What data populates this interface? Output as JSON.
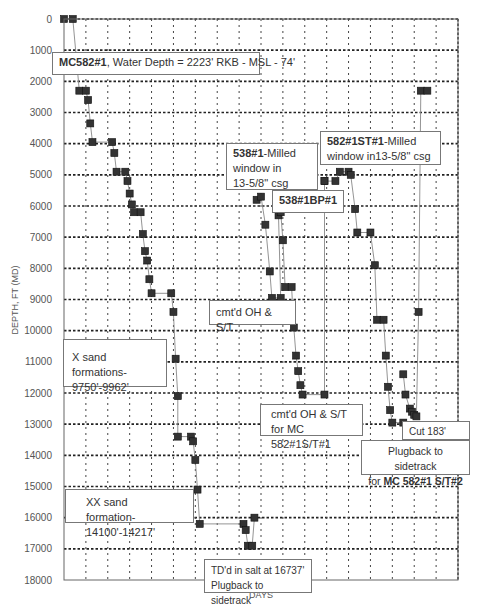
{
  "chart_data": {
    "type": "line",
    "title": "",
    "xlabel": "DAYS",
    "ylabel": "DEPTH, FT (MD)",
    "ylim": [
      0,
      18000
    ],
    "y_inverted": true,
    "xlim": [
      0,
      18
    ],
    "grid": true,
    "yticks": [
      0,
      1000,
      2000,
      3000,
      4000,
      5000,
      6000,
      7000,
      8000,
      9000,
      10000,
      11000,
      12000,
      13000,
      14000,
      15000,
      16000,
      17000,
      18000
    ],
    "series": [
      {
        "name": "MC582#1 original hole",
        "points": [
          [
            0.0,
            0
          ],
          [
            0.4,
            0
          ],
          [
            0.7,
            2300
          ],
          [
            1.0,
            2300
          ],
          [
            1.1,
            2600
          ],
          [
            1.2,
            3350
          ],
          [
            1.3,
            3950
          ],
          [
            2.2,
            3950
          ],
          [
            2.3,
            4300
          ],
          [
            2.4,
            4900
          ],
          [
            2.8,
            4900
          ],
          [
            2.9,
            5200
          ],
          [
            3.0,
            5600
          ],
          [
            3.1,
            5950
          ],
          [
            3.2,
            6200
          ],
          [
            3.5,
            6200
          ],
          [
            3.6,
            6900
          ],
          [
            3.7,
            7450
          ],
          [
            3.8,
            7750
          ],
          [
            3.9,
            8350
          ],
          [
            4.0,
            8800
          ],
          [
            4.9,
            8800
          ],
          [
            5.0,
            9400
          ],
          [
            5.1,
            10900
          ],
          [
            5.2,
            12100
          ],
          [
            5.2,
            13400
          ],
          [
            5.8,
            13400
          ],
          [
            5.9,
            13550
          ],
          [
            6.0,
            14150
          ],
          [
            6.1,
            15100
          ],
          [
            6.2,
            16200
          ],
          [
            8.2,
            16200
          ],
          [
            8.3,
            16400
          ],
          [
            8.4,
            16900
          ],
          [
            8.6,
            16900
          ],
          [
            8.7,
            16000
          ]
        ]
      },
      {
        "name": "538#1 milled window / 538#1BP#1",
        "points": [
          [
            8.8,
            5800
          ],
          [
            9.0,
            5700
          ],
          [
            9.2,
            6600
          ],
          [
            9.4,
            8100
          ],
          [
            9.5,
            8950
          ],
          [
            9.9,
            8950
          ],
          [
            9.8,
            6300
          ],
          [
            9.9,
            6200
          ],
          [
            10.0,
            7100
          ],
          [
            10.1,
            8600
          ],
          [
            10.4,
            8600
          ],
          [
            10.5,
            9900
          ],
          [
            10.6,
            10800
          ],
          [
            10.7,
            11300
          ],
          [
            10.8,
            11750
          ],
          [
            10.9,
            12050
          ],
          [
            11.9,
            12050
          ],
          [
            11.9,
            5200
          ]
        ]
      },
      {
        "name": "582#1ST#1",
        "points": [
          [
            11.9,
            5200
          ],
          [
            12.4,
            5200
          ],
          [
            12.6,
            4900
          ],
          [
            13.0,
            4900
          ],
          [
            13.1,
            5000
          ],
          [
            13.3,
            6100
          ],
          [
            13.4,
            6850
          ],
          [
            14.0,
            6850
          ],
          [
            14.2,
            7900
          ],
          [
            14.3,
            9650
          ],
          [
            14.6,
            9650
          ],
          [
            14.7,
            10800
          ],
          [
            14.8,
            11800
          ],
          [
            14.9,
            12550
          ],
          [
            15.0,
            12950
          ],
          [
            15.5,
            12950
          ]
        ]
      },
      {
        "name": "MC582#1 S/T#2",
        "points": [
          [
            15.5,
            11400
          ],
          [
            15.6,
            12050
          ],
          [
            15.8,
            12500
          ],
          [
            15.9,
            12600
          ],
          [
            16.0,
            12700
          ],
          [
            16.1,
            12750
          ],
          [
            16.2,
            9400
          ],
          [
            16.3,
            2300
          ],
          [
            16.6,
            2300
          ]
        ]
      }
    ],
    "annotations": [
      {
        "text": "MC582#1, Water Depth = 2223' RKB - MSL - 74'",
        "bold_part": "MC582#1"
      },
      {
        "text": "538#1-Milled window in 13-5/8\" csg",
        "bold_part": "538#1"
      },
      {
        "text": "538#1BP#1"
      },
      {
        "text": "582#1ST#1-Milled window in13-5/8\" csg",
        "bold_part": "582#1ST#1"
      },
      {
        "text": "cmt'd OH & S/T"
      },
      {
        "text": "X sand formations- 9750'-9962'"
      },
      {
        "text": "cmt'd OH & S/T for MC 582#1S/T#1"
      },
      {
        "text": "Cut 183' conv."
      },
      {
        "text": "Plugback to sidetrack for MC 582#1 S/T#2",
        "bold_part": "MC 582#1 S/T#2"
      },
      {
        "text": "XX sand formation- 14100'-14217'"
      },
      {
        "text": "TD'd in salt at 16737' Plugback to sidetrack"
      }
    ]
  },
  "labels": {
    "xlabel": "DAYS",
    "ylabel": "DEPTH, FT (MD)",
    "note_water_depth_bold": "MC582#1",
    "note_water_depth_rest": ", Water Depth = 2223' RKB - MSL - 74'",
    "note_538_bold": "538#1",
    "note_538_rest": "-Milled\nwindow in\n13-5/8\" csg",
    "note_538bp": "538#1BP#1",
    "note_582st_bold": "582#1ST#1",
    "note_582st_rest": "-Milled\nwindow in13-5/8\" csg",
    "note_cmtd1": "cmt'd OH & S/T",
    "note_xsand": "X sand formations-\n9750'-9962'",
    "note_cmtd2": "cmt'd OH & S/T\nfor MC 582#1S/T#1",
    "note_cut": "Cut 183' conv.",
    "note_plugback_line1": "Plugback to sidetrack",
    "note_plugback_for": "for ",
    "note_plugback_bold": "MC 582#1 S/T#2",
    "note_xxsand": "XX sand formation-\n14100'-14217'",
    "note_td": "TD'd in salt at 16737'\nPlugback to sidetrack"
  }
}
